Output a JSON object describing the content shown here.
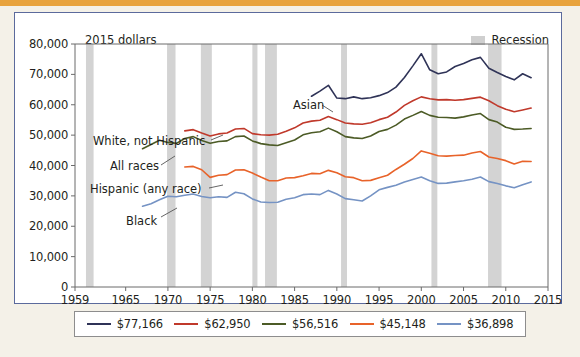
{
  "figure": {
    "units_label": "2015 dollars",
    "recession_legend_label": "Recession"
  },
  "chart_data": {
    "type": "line",
    "title": "",
    "subtitle": "2015 dollars",
    "xlabel": "",
    "ylabel": "",
    "xlim": [
      1959,
      2015
    ],
    "ylim": [
      0,
      80000
    ],
    "grid": false,
    "legend_position": "below",
    "x_ticks": [
      1959,
      1965,
      1970,
      1975,
      1980,
      1985,
      1990,
      1995,
      2000,
      2005,
      2010,
      2015
    ],
    "y_ticks": [
      0,
      10000,
      20000,
      30000,
      40000,
      50000,
      60000,
      70000,
      80000
    ],
    "y_tick_labels": [
      "0",
      "10,000",
      "20,000",
      "30,000",
      "40,000",
      "50,000",
      "60,000",
      "70,000",
      "80,000"
    ],
    "recessions": [
      {
        "start": 1960.3,
        "end": 1961.2
      },
      {
        "start": 1969.9,
        "end": 1970.9
      },
      {
        "start": 1973.9,
        "end": 1975.2
      },
      {
        "start": 1980.0,
        "end": 1980.6
      },
      {
        "start": 1981.5,
        "end": 1982.9
      },
      {
        "start": 1990.5,
        "end": 1991.2
      },
      {
        "start": 2001.2,
        "end": 2001.9
      },
      {
        "start": 2007.9,
        "end": 2009.5
      }
    ],
    "series": [
      {
        "name": "Asian",
        "label": "Asian",
        "legend_value": "$77,166",
        "color": "#2f3357",
        "x": [
          1987,
          1988,
          1989,
          1990,
          1991,
          1992,
          1993,
          1994,
          1995,
          1996,
          1997,
          1998,
          1999,
          2000,
          2001,
          2002,
          2003,
          2004,
          2005,
          2006,
          2007,
          2008,
          2009,
          2010,
          2011,
          2012,
          2013
        ],
        "y": [
          62800,
          64500,
          66400,
          62200,
          62000,
          62600,
          62000,
          62300,
          63000,
          64000,
          65800,
          69000,
          72800,
          76800,
          71500,
          70200,
          70800,
          72600,
          73600,
          74800,
          75600,
          72000,
          70600,
          69300,
          68200,
          70200,
          68900
        ]
      },
      {
        "name": "White, not Hispanic",
        "label": "White, not Hispanic",
        "legend_value": "$62,950",
        "color": "#c0392b",
        "x": [
          1972,
          1973,
          1974,
          1975,
          1976,
          1977,
          1978,
          1979,
          1980,
          1981,
          1982,
          1983,
          1984,
          1985,
          1986,
          1987,
          1988,
          1989,
          1990,
          1991,
          1992,
          1993,
          1994,
          1995,
          1996,
          1997,
          1998,
          1999,
          2000,
          2001,
          2002,
          2003,
          2004,
          2005,
          2006,
          2007,
          2008,
          2009,
          2010,
          2011,
          2012,
          2013
        ],
        "y": [
          51400,
          51800,
          50700,
          49700,
          50400,
          50700,
          52000,
          52200,
          50500,
          50100,
          50000,
          50300,
          51300,
          52400,
          54000,
          54600,
          54900,
          56100,
          55100,
          54000,
          53700,
          53600,
          54100,
          55100,
          55900,
          57600,
          59800,
          61300,
          62600,
          62000,
          61600,
          61700,
          61500,
          61700,
          62100,
          62500,
          61300,
          59700,
          58500,
          57700,
          58300,
          58900
        ]
      },
      {
        "name": "All races",
        "label": "All races",
        "legend_value": "$56,516",
        "color": "#4c5b26",
        "x": [
          1967,
          1968,
          1969,
          1970,
          1971,
          1972,
          1973,
          1974,
          1975,
          1976,
          1977,
          1978,
          1979,
          1980,
          1981,
          1982,
          1983,
          1984,
          1985,
          1986,
          1987,
          1988,
          1989,
          1990,
          1991,
          1992,
          1993,
          1994,
          1995,
          1996,
          1997,
          1998,
          1999,
          2000,
          2001,
          2002,
          2003,
          2004,
          2005,
          2006,
          2007,
          2008,
          2009,
          2010,
          2011,
          2012,
          2013
        ],
        "y": [
          45500,
          46900,
          48300,
          47600,
          47300,
          48900,
          49500,
          48200,
          47300,
          47900,
          48100,
          49500,
          49700,
          48100,
          47200,
          46800,
          46600,
          47500,
          48400,
          50100,
          50800,
          51100,
          52300,
          51100,
          49500,
          49100,
          48900,
          49700,
          51200,
          51900,
          53300,
          55300,
          56500,
          57800,
          56500,
          55900,
          55800,
          55600,
          56000,
          56600,
          57100,
          55100,
          54300,
          52600,
          51900,
          52000,
          52200
        ]
      },
      {
        "name": "Hispanic (any race)",
        "label": "Hispanic (any race)",
        "legend_value": "$45,148",
        "color": "#e8632a",
        "x": [
          1972,
          1973,
          1974,
          1975,
          1976,
          1977,
          1978,
          1979,
          1980,
          1981,
          1982,
          1983,
          1984,
          1985,
          1986,
          1987,
          1988,
          1989,
          1990,
          1991,
          1992,
          1993,
          1994,
          1995,
          1996,
          1997,
          1998,
          1999,
          2000,
          2001,
          2002,
          2003,
          2004,
          2005,
          2006,
          2007,
          2008,
          2009,
          2010,
          2011,
          2012,
          2013
        ],
        "y": [
          39500,
          39700,
          38600,
          36100,
          36800,
          37000,
          38500,
          38600,
          37500,
          36200,
          35000,
          35000,
          35900,
          36000,
          36600,
          37400,
          37300,
          38400,
          37600,
          36300,
          36000,
          35000,
          35100,
          36000,
          36800,
          38700,
          40400,
          42300,
          44800,
          44000,
          43200,
          43100,
          43300,
          43400,
          44100,
          44600,
          42800,
          42300,
          41600,
          40500,
          41400,
          41300
        ]
      },
      {
        "name": "Black",
        "label": "Black",
        "legend_value": "$36,898",
        "color": "#7593c4",
        "x": [
          1967,
          1968,
          1969,
          1970,
          1971,
          1972,
          1973,
          1974,
          1975,
          1976,
          1977,
          1978,
          1979,
          1980,
          1981,
          1982,
          1983,
          1984,
          1985,
          1986,
          1987,
          1988,
          1989,
          1990,
          1991,
          1992,
          1993,
          1994,
          1995,
          1996,
          1997,
          1998,
          1999,
          2000,
          2001,
          2002,
          2003,
          2004,
          2005,
          2006,
          2007,
          2008,
          2009,
          2010,
          2011,
          2012,
          2013
        ],
        "y": [
          26600,
          27400,
          28700,
          29900,
          29700,
          30200,
          30600,
          29800,
          29400,
          29700,
          29500,
          31200,
          30700,
          29000,
          28000,
          27800,
          27900,
          28900,
          29400,
          30400,
          30600,
          30400,
          31800,
          30600,
          29100,
          28700,
          28300,
          30000,
          32000,
          32800,
          33500,
          34600,
          35400,
          36200,
          35000,
          34100,
          34200,
          34600,
          35000,
          35500,
          36200,
          34700,
          34100,
          33300,
          32700,
          33700,
          34600
        ]
      }
    ]
  },
  "series_annotations": [
    {
      "name": "asian-label",
      "text": "Asian",
      "left": 278,
      "top": 85
    },
    {
      "name": "white-label",
      "text": "White, not Hispanic",
      "left": 78,
      "top": 121
    },
    {
      "name": "all-races-label",
      "text": "All races",
      "left": 95,
      "top": 146
    },
    {
      "name": "hispanic-label",
      "text": "Hispanic (any race)",
      "left": 75,
      "top": 169
    },
    {
      "name": "black-label",
      "text": "Black",
      "left": 111,
      "top": 201
    }
  ],
  "legend": {
    "items": [
      {
        "value": "$77,166",
        "color": "#2f3357",
        "series": "Asian"
      },
      {
        "value": "$62,950",
        "color": "#c0392b",
        "series": "White, not Hispanic"
      },
      {
        "value": "$56,516",
        "color": "#4c5b26",
        "series": "All races"
      },
      {
        "value": "$45,148",
        "color": "#e8632a",
        "series": "Hispanic (any race)"
      },
      {
        "value": "$36,898",
        "color": "#7593c4",
        "series": "Black"
      }
    ]
  }
}
